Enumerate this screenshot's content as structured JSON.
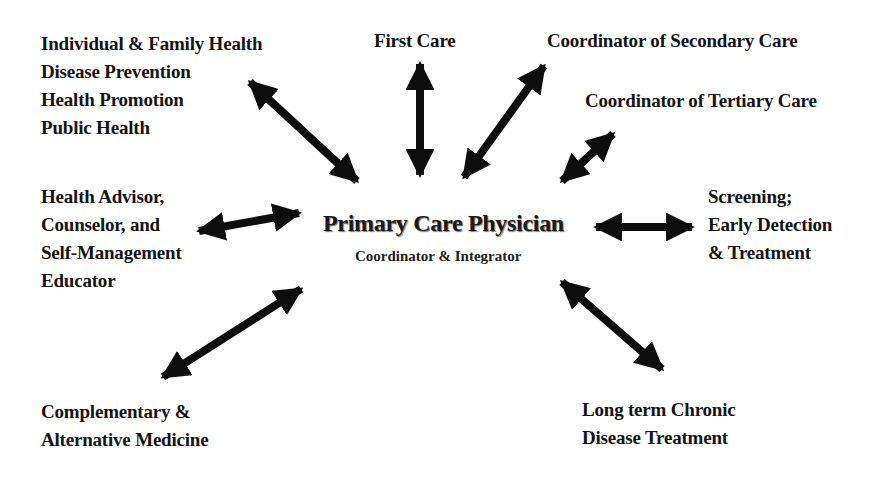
{
  "diagram": {
    "center": {
      "title": "Primary Care Physician",
      "subtitle": "Coordinator & Integrator"
    },
    "nodes": [
      {
        "id": "individual",
        "lines": [
          "Individual & Family Health",
          "Disease Prevention",
          "Health Promotion",
          "Public Health"
        ]
      },
      {
        "id": "first-care",
        "lines": [
          "First Care"
        ]
      },
      {
        "id": "secondary",
        "lines": [
          "Coordinator of Secondary Care"
        ]
      },
      {
        "id": "tertiary",
        "lines": [
          "Coordinator of Tertiary Care"
        ]
      },
      {
        "id": "advisor",
        "lines": [
          "Health Advisor,",
          "Counselor, and",
          "Self-Management",
          "Educator"
        ]
      },
      {
        "id": "screening",
        "lines": [
          "Screening;",
          "Early Detection",
          "& Treatment"
        ]
      },
      {
        "id": "complementary",
        "lines": [
          "Complementary &",
          "Alternative Medicine"
        ]
      },
      {
        "id": "chronic",
        "lines": [
          "Long term Chronic",
          "Disease Treatment"
        ]
      }
    ],
    "arrows": [
      {
        "to": "individual",
        "type": "bidirectional"
      },
      {
        "to": "first-care",
        "type": "bidirectional"
      },
      {
        "to": "secondary",
        "type": "bidirectional"
      },
      {
        "to": "tertiary",
        "type": "bidirectional"
      },
      {
        "to": "advisor",
        "type": "bidirectional"
      },
      {
        "to": "screening",
        "type": "bidirectional"
      },
      {
        "to": "complementary",
        "type": "bidirectional"
      },
      {
        "to": "chronic",
        "type": "bidirectional"
      }
    ],
    "colors": {
      "arrow": "#0d0d0d",
      "text": "#141414",
      "background": "#ffffff"
    }
  }
}
